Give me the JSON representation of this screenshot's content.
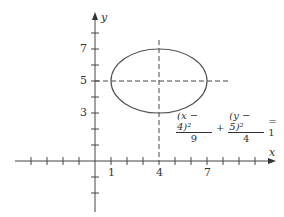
{
  "axes": {
    "x_label": "x",
    "y_label": "y"
  },
  "x_ticks": [
    {
      "value": 1,
      "label": "1"
    },
    {
      "value": 4,
      "label": "4"
    },
    {
      "value": 7,
      "label": "7"
    }
  ],
  "y_ticks": [
    {
      "value": 3,
      "label": "3"
    },
    {
      "value": 5,
      "label": "5"
    },
    {
      "value": 7,
      "label": "7"
    }
  ],
  "ellipse": {
    "center": [
      4,
      5
    ],
    "a": 3,
    "b": 2,
    "color": "#555555"
  },
  "equation": {
    "term1_num": "(x − 4)²",
    "term1_den": "9",
    "plus": "+",
    "term2_num": "(y − 5)²",
    "term2_den": "4",
    "rhs": "= 1"
  }
}
